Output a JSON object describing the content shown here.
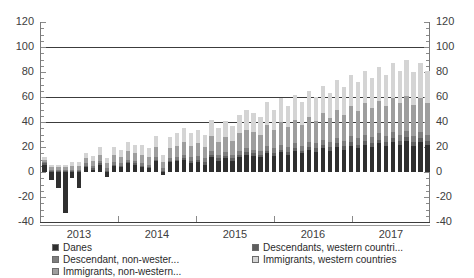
{
  "chart_data": {
    "type": "bar",
    "title": "",
    "xlabel": "",
    "ylabel": "",
    "ylim": [
      -40,
      120
    ],
    "yticks": [
      -40,
      -20,
      0,
      20,
      40,
      60,
      80,
      100,
      120
    ],
    "gridlines": [
      40,
      60,
      100
    ],
    "grid": true,
    "stacked": true,
    "dual_axis": true,
    "left_axis_ticks": [
      "120",
      "100",
      "80",
      "60",
      "40",
      "20",
      "0",
      "-20",
      "-40"
    ],
    "right_axis_ticks": [
      "120",
      "100",
      "80",
      "60",
      "40",
      "20",
      "0",
      "-20",
      "-40"
    ],
    "xlabels": [
      "2013",
      "2014",
      "2015",
      "2016",
      "2017"
    ],
    "legend_position": "bottom",
    "series": [
      {
        "name": "Danes",
        "color": "#2f2f2f",
        "values": [
          6,
          -6,
          -13,
          -33,
          -5,
          -13,
          4,
          2,
          6,
          -4,
          5,
          4,
          7,
          6,
          4,
          3,
          9,
          -2,
          8,
          9,
          10,
          7,
          8,
          6,
          12,
          9,
          11,
          9,
          12,
          14,
          13,
          12,
          15,
          13,
          16,
          14,
          17,
          15,
          18,
          16,
          19,
          17,
          20,
          18,
          21,
          19,
          22,
          20,
          23,
          21,
          24,
          22,
          25,
          21,
          24,
          22
        ]
      },
      {
        "name": "Descendants, western countri...",
        "color": "#5e5e5e",
        "values": [
          1,
          1,
          1,
          1,
          1,
          1,
          1,
          1,
          1,
          1,
          1,
          1,
          1,
          1,
          1,
          1,
          1,
          1,
          1,
          1,
          1,
          2,
          2,
          2,
          2,
          2,
          2,
          2,
          2,
          2,
          2,
          2,
          2,
          2,
          2,
          2,
          2,
          2,
          2,
          3,
          3,
          3,
          3,
          3,
          3,
          3,
          3,
          3,
          3,
          3,
          3,
          3,
          3,
          3,
          3,
          3
        ]
      },
      {
        "name": "Descendant, non-wester...",
        "color": "#7d7d7d",
        "values": [
          1,
          1,
          1,
          1,
          1,
          1,
          2,
          2,
          2,
          2,
          2,
          2,
          2,
          2,
          2,
          2,
          2,
          2,
          2,
          2,
          3,
          3,
          3,
          3,
          3,
          3,
          3,
          3,
          3,
          3,
          3,
          3,
          4,
          4,
          4,
          4,
          4,
          4,
          4,
          4,
          4,
          4,
          4,
          4,
          5,
          5,
          5,
          5,
          5,
          5,
          5,
          5,
          5,
          5,
          5,
          5
        ]
      },
      {
        "name": "Immigrants, western countries",
        "color": "#d4d4d4",
        "values": [
          2,
          2,
          2,
          2,
          3,
          3,
          4,
          4,
          6,
          4,
          6,
          6,
          7,
          7,
          8,
          7,
          9,
          6,
          9,
          10,
          11,
          10,
          11,
          10,
          13,
          11,
          13,
          12,
          15,
          16,
          15,
          14,
          18,
          16,
          19,
          17,
          20,
          18,
          21,
          19,
          22,
          20,
          24,
          22,
          25,
          23,
          26,
          24,
          27,
          25,
          28,
          26,
          29,
          26,
          28,
          26
        ]
      },
      {
        "name": "Immigrants, non-western...",
        "color": "#9e9e9e",
        "values": [
          2,
          2,
          2,
          2,
          3,
          3,
          4,
          4,
          5,
          4,
          6,
          5,
          7,
          6,
          7,
          6,
          8,
          5,
          8,
          9,
          10,
          9,
          10,
          9,
          12,
          10,
          12,
          11,
          14,
          15,
          14,
          13,
          17,
          15,
          18,
          16,
          19,
          17,
          20,
          18,
          21,
          19,
          23,
          21,
          24,
          22,
          25,
          23,
          26,
          24,
          27,
          25,
          28,
          25,
          27,
          25
        ]
      }
    ],
    "legend_left": [
      {
        "name": "Danes",
        "color": "#2f2f2f"
      },
      {
        "name": "Descendant, non-wester...",
        "color": "#7d7d7d"
      },
      {
        "name": "Immigrants, non-western...",
        "color": "#9e9e9e"
      }
    ],
    "legend_right": [
      {
        "name": "Descendants, western countri...",
        "color": "#5e5e5e"
      },
      {
        "name": "Immigrants, western countries",
        "color": "#d4d4d4"
      }
    ]
  }
}
